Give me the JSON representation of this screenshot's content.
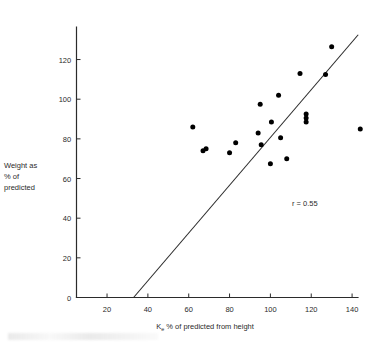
{
  "figure": {
    "axis_color": "#2b2b2b",
    "point_color": "#000000",
    "background": "#ffffff"
  },
  "labels": {
    "ylabel_line1": "Weight as",
    "ylabel_line2": "% of",
    "ylabel_line3": "predicted",
    "xlabel_prefix": "K",
    "xlabel_subscript": "e",
    "xlabel_suffix": " % of predicted from height",
    "annotation": "r = 0.55"
  },
  "chart_data": {
    "type": "scatter",
    "title": "",
    "xlabel": "Ke % of predicted from height",
    "ylabel": "Weight as % of predicted",
    "xlim": [
      0,
      148
    ],
    "ylim": [
      0,
      140
    ],
    "xticks": [
      20,
      40,
      60,
      80,
      100,
      120,
      140
    ],
    "yticks": [
      0,
      20,
      40,
      60,
      80,
      100,
      120
    ],
    "xtick_labels": [
      "20",
      "40",
      "60",
      "80",
      "100",
      "120",
      "140"
    ],
    "ytick_labels": [
      "0",
      "20",
      "40",
      "60",
      "80",
      "100",
      "120"
    ],
    "grid": false,
    "legend": false,
    "annotations": [
      {
        "text": "r = 0.55",
        "x": 122,
        "y": 52
      }
    ],
    "series": [
      {
        "name": "subjects",
        "marker": "filled-circle",
        "color": "#000000",
        "points": [
          {
            "x": 62,
            "y": 86
          },
          {
            "x": 67,
            "y": 74
          },
          {
            "x": 68.5,
            "y": 75
          },
          {
            "x": 80,
            "y": 73
          },
          {
            "x": 83,
            "y": 78
          },
          {
            "x": 94,
            "y": 83
          },
          {
            "x": 95,
            "y": 97.5
          },
          {
            "x": 95.5,
            "y": 77
          },
          {
            "x": 100.5,
            "y": 88.5
          },
          {
            "x": 100,
            "y": 67.5
          },
          {
            "x": 104,
            "y": 102
          },
          {
            "x": 105,
            "y": 80.5
          },
          {
            "x": 108,
            "y": 70
          },
          {
            "x": 114.5,
            "y": 113
          },
          {
            "x": 117.5,
            "y": 92.5
          },
          {
            "x": 117.5,
            "y": 90.5
          },
          {
            "x": 117.5,
            "y": 88.5
          },
          {
            "x": 127,
            "y": 112.5
          },
          {
            "x": 130,
            "y": 126.5
          },
          {
            "x": 144,
            "y": 85
          }
        ]
      }
    ],
    "fit_line": {
      "name": "regression-line",
      "color": "#2b2b2b",
      "x0": 33,
      "y0": 0,
      "x1": 143,
      "y1": 132.5
    }
  }
}
